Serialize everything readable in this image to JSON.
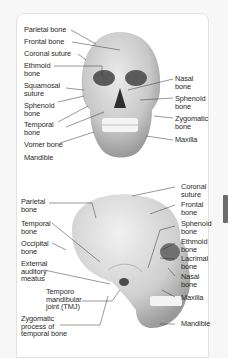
{
  "diagram": {
    "frontal_view": {
      "left_labels": [
        "Parietal bone",
        "Frontal bone",
        "Coronal suture",
        "Ethmoid\nbone",
        "Squamosal\nsuture",
        "Sphenoid\nbone",
        "Temporal\nbone",
        "Vomer bone",
        "Mandible"
      ],
      "right_labels": [
        "Nasal\nbone",
        "Sphenoid\nbone",
        "Zygomatic\nbone",
        "Maxilla"
      ]
    },
    "lateral_view": {
      "left_labels": [
        "Parietal\nbone",
        "Temporal\nbone",
        "Occipital\nbone",
        "External\nauditory\nmeatus",
        "Temporo\nmandibular\njoint (TMJ)",
        "Zygomatic\nprocess of\ntemporal bone"
      ],
      "right_labels": [
        "Coronal\nsuture",
        "Frontal\nbone",
        "Sphenoid\nbone",
        "Ethmoid\nbone",
        "Lacrimal\nbone",
        "Nasal\nbone",
        "Maxilla",
        "Mandible"
      ]
    }
  }
}
